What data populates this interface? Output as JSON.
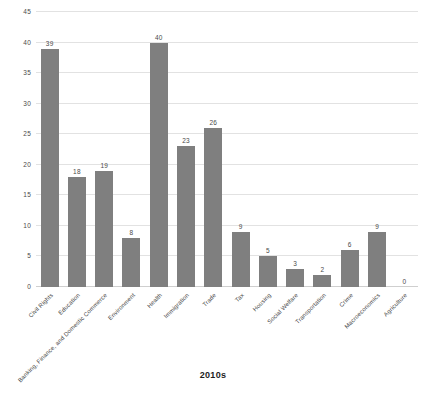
{
  "chart_data": {
    "type": "bar",
    "title": "2010s",
    "xlabel": "",
    "ylabel": "",
    "ylim": [
      0,
      45
    ],
    "yticks": [
      0,
      5,
      10,
      15,
      20,
      25,
      30,
      35,
      40,
      45
    ],
    "grid": true,
    "legend": false,
    "bar_color": "#7f7f7f",
    "show_value_labels": true,
    "categories": [
      "Civil Rights",
      "Education",
      "Banking, Finance, and Domestic Commerce",
      "Environment",
      "Health",
      "Immigration",
      "Trade",
      "Tax",
      "Housing",
      "Social Welfare",
      "Transportation",
      "Crime",
      "Macroeconomics",
      "Agriculture"
    ],
    "values": [
      39,
      18,
      19,
      8,
      40,
      23,
      26,
      9,
      5,
      3,
      2,
      6,
      9,
      0
    ]
  }
}
